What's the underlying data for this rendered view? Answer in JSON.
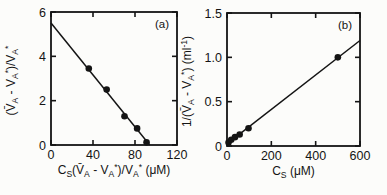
{
  "figure": {
    "background": "#fcfcfa",
    "ink": "#141414"
  },
  "chart_data": [
    {
      "type": "scatter",
      "panel_label": "(a)",
      "title": "",
      "xlabel": "C_{S}(V̄_{A} - V_{A}^{*})/V_{A}^{*} (μM)",
      "ylabel": "(V̄_{A} - V_{A}^{*})/V_{A}^{*}",
      "xlim": [
        0,
        120
      ],
      "ylim": [
        0,
        6
      ],
      "xticks": [
        0,
        40,
        80,
        120
      ],
      "xtick_labels": [
        "0",
        "40",
        "80",
        "120"
      ],
      "yticks": [
        0,
        2,
        4,
        6
      ],
      "ytick_labels": [
        "0",
        "2",
        "4",
        "6"
      ],
      "grid": false,
      "legend": "none",
      "points": [
        [
          36,
          3.45
        ],
        [
          53,
          2.5
        ],
        [
          70,
          1.3
        ],
        [
          82,
          0.75
        ],
        [
          91,
          0.12
        ]
      ],
      "fit_line": {
        "x1": 0,
        "y1": 5.5,
        "x2": 94,
        "y2": 0
      }
    },
    {
      "type": "scatter",
      "panel_label": "(b)",
      "title": "",
      "xlabel": "C_{S} (μM)",
      "ylabel": "1/(V̄_{A} - V_{A}^{*}) (ml^{-1})",
      "xlim": [
        0,
        600
      ],
      "ylim": [
        0,
        1.5
      ],
      "xticks": [
        0,
        200,
        400,
        600
      ],
      "xtick_labels": [
        "0",
        "200",
        "400",
        "600"
      ],
      "yticks": [
        0,
        0.5,
        1.0,
        1.5
      ],
      "ytick_labels": [
        "0",
        "0.5",
        "1.0",
        "1.5"
      ],
      "grid": false,
      "legend": "none",
      "points": [
        [
          7,
          0.04
        ],
        [
          19,
          0.07
        ],
        [
          36,
          0.1
        ],
        [
          57,
          0.13
        ],
        [
          97,
          0.2
        ],
        [
          500,
          1.0
        ]
      ],
      "fit_line": {
        "x1": 0,
        "y1": 0.025,
        "x2": 600,
        "y2": 1.19
      }
    }
  ]
}
